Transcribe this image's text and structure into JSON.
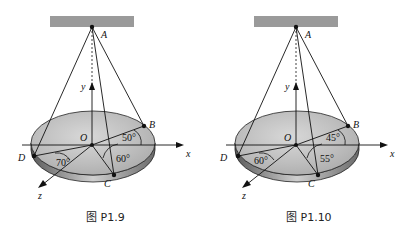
{
  "figures": [
    {
      "caption": "图 P1.9",
      "labels": {
        "A": "A",
        "B": "B",
        "C": "C",
        "D": "D",
        "O": "O",
        "x": "x",
        "y": "y",
        "z": "z"
      },
      "angles": {
        "B": "50°",
        "C": "60°",
        "D": "70°"
      }
    },
    {
      "caption": "图 P1.10",
      "labels": {
        "A": "A",
        "B": "B",
        "C": "C",
        "D": "D",
        "O": "O",
        "x": "x",
        "y": "y",
        "z": "z"
      },
      "angles": {
        "B": "45°",
        "C": "55°",
        "D": "60°"
      }
    }
  ],
  "colors": {
    "ceiling": "#9a9a9a",
    "plate_top": "#c8c8c8",
    "plate_edge": "#8c8c8c",
    "line": "#111111"
  }
}
